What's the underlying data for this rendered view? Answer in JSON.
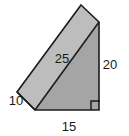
{
  "figure": {
    "shape_type": "triangular-prism",
    "projection": "oblique",
    "colors": {
      "front_face": "#a8a8a8",
      "top_face": "#bfbfbf",
      "back_face": "#b5b5b5",
      "outline": "#1c1c1c",
      "background": "#ffffff",
      "label_text": "#1a1a1a"
    },
    "labels": [
      {
        "id": "slant",
        "text": "25",
        "x": 62,
        "y": 63,
        "anchor": "middle",
        "edge": "hypotenuse-top-slant"
      },
      {
        "id": "height",
        "text": "20",
        "x": 110,
        "y": 69,
        "anchor": "middle",
        "edge": "right-vertical"
      },
      {
        "id": "depth",
        "text": "10",
        "x": 16,
        "y": 105,
        "anchor": "middle",
        "edge": "left-depth"
      },
      {
        "id": "base",
        "text": "15",
        "x": 69,
        "y": 131,
        "anchor": "middle",
        "edge": "bottom-horizontal"
      }
    ],
    "right_angle_marker": {
      "present": true,
      "vertex": "bottom-right",
      "x": 91,
      "y": 99,
      "size": 9
    },
    "geometry": {
      "front_triangle": "35,110 99,110 99,22",
      "top_slant_face": "35,110 99,22 81,5 17,92",
      "back_left_face": "17,92 35,110 35,110",
      "left_end_face": "17,92 35,110 35,110 17,92",
      "outline_path": "81,5 99,22 99,110 35,110 17,92",
      "edge_slant": "35,110 99,22",
      "edge_depth_left": "17,92 35,110",
      "edge_top_ridge": "81,5 17,92",
      "edge_apex_right": "81,5 99,22"
    }
  }
}
